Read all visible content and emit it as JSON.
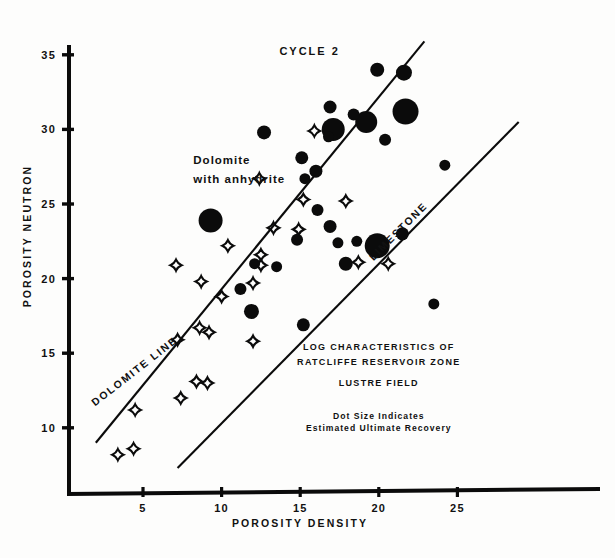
{
  "chart_data": {
    "type": "scatter",
    "subtitle": "LUSTRE FIELD",
    "xlabel": "POROSITY DENSITY",
    "ylabel": "POROSITY NEUTRON",
    "xlim": [
      1.5,
      28.5
    ],
    "ylim": [
      7.2,
      36.4
    ],
    "xticks": [
      5,
      10,
      15,
      20,
      25
    ],
    "yticks": [
      10,
      15,
      20,
      25,
      30,
      35
    ],
    "grid": false,
    "legend": "none",
    "annotations": [
      {
        "name": "cycle-label",
        "text": "CYCLE 2",
        "x": 15.6,
        "y": 35.0
      },
      {
        "name": "dolomite-anhydrite-label-line1",
        "text": "Dolomite",
        "x": 8.2,
        "y": 27.7
      },
      {
        "name": "dolomite-anhydrite-label-line2",
        "text": "with anhydrite",
        "x": 8.2,
        "y": 26.4
      },
      {
        "name": "dolomite-line-label",
        "text": "DOLOMITE LINE",
        "x": 4.6,
        "y": 13.6,
        "rotation": -38
      },
      {
        "name": "limestone-line-label",
        "text": "LIMESTONE",
        "x": 21.4,
        "y": 23.0,
        "rotation": -45
      },
      {
        "name": "title-block-line1",
        "text": "LOG CHARACTERISTICS OF",
        "x": 20.0,
        "y": 15.2
      },
      {
        "name": "title-block-line2",
        "text": "RATCLIFFE RESERVOIR ZONE",
        "x": 20.0,
        "y": 14.2
      },
      {
        "name": "title-block-line3",
        "text": "LUSTRE FIELD",
        "x": 20.0,
        "y": 12.8
      },
      {
        "name": "legend-note-line1",
        "text": "Dot Size Indicates",
        "x": 20.0,
        "y": 10.6
      },
      {
        "name": "legend-note-line2",
        "text": "Estimated Ultimate Recovery",
        "x": 20.0,
        "y": 9.8
      }
    ],
    "reference_lines": [
      {
        "name": "dolomite-line",
        "label": "DOLOMITE LINE",
        "x0": 2.0,
        "y0": 9.0,
        "x1": 22.9,
        "y1": 35.9
      },
      {
        "name": "limestone-line",
        "label": "LIMESTONE",
        "x0": 7.2,
        "y0": 7.3,
        "x1": 28.9,
        "y1": 30.5
      }
    ],
    "series": [
      {
        "name": "Wells (dot size = estimated ultimate recovery)",
        "marker": "filled-circle",
        "points": [
          {
            "x": 21.6,
            "y": 33.8,
            "r": 8.0
          },
          {
            "x": 19.9,
            "y": 34.0,
            "r": 7.0
          },
          {
            "x": 16.9,
            "y": 31.5,
            "r": 6.5
          },
          {
            "x": 17.1,
            "y": 30.0,
            "r": 11.5
          },
          {
            "x": 19.2,
            "y": 30.5,
            "r": 11.0
          },
          {
            "x": 21.7,
            "y": 31.2,
            "r": 13.0
          },
          {
            "x": 12.7,
            "y": 29.8,
            "r": 7.0
          },
          {
            "x": 16.8,
            "y": 29.5,
            "r": 5.5
          },
          {
            "x": 18.4,
            "y": 31.0,
            "r": 6.0
          },
          {
            "x": 20.4,
            "y": 29.3,
            "r": 6.0
          },
          {
            "x": 15.1,
            "y": 28.1,
            "r": 6.5
          },
          {
            "x": 15.3,
            "y": 26.7,
            "r": 5.5
          },
          {
            "x": 16.0,
            "y": 27.2,
            "r": 6.5
          },
          {
            "x": 24.2,
            "y": 27.6,
            "r": 5.5
          },
          {
            "x": 9.3,
            "y": 23.9,
            "r": 12.0
          },
          {
            "x": 16.1,
            "y": 24.6,
            "r": 6.0
          },
          {
            "x": 16.9,
            "y": 23.5,
            "r": 6.5
          },
          {
            "x": 14.8,
            "y": 22.6,
            "r": 6.0
          },
          {
            "x": 17.4,
            "y": 22.4,
            "r": 5.5
          },
          {
            "x": 18.6,
            "y": 22.5,
            "r": 5.5
          },
          {
            "x": 19.9,
            "y": 22.2,
            "r": 12.5
          },
          {
            "x": 21.5,
            "y": 23.0,
            "r": 6.5
          },
          {
            "x": 12.1,
            "y": 21.0,
            "r": 5.5
          },
          {
            "x": 13.5,
            "y": 20.8,
            "r": 5.5
          },
          {
            "x": 17.9,
            "y": 21.0,
            "r": 7.0
          },
          {
            "x": 11.2,
            "y": 19.3,
            "r": 6.0
          },
          {
            "x": 11.9,
            "y": 17.8,
            "r": 7.5
          },
          {
            "x": 15.2,
            "y": 16.9,
            "r": 6.5
          },
          {
            "x": 23.5,
            "y": 18.3,
            "r": 5.5
          }
        ]
      },
      {
        "name": "Dolomite with anhydrite",
        "marker": "four-point-star",
        "points": [
          {
            "x": 15.9,
            "y": 29.9,
            "r": 5.5
          },
          {
            "x": 12.4,
            "y": 26.7,
            "r": 5.5
          },
          {
            "x": 15.2,
            "y": 25.3,
            "r": 5.5
          },
          {
            "x": 17.9,
            "y": 25.2,
            "r": 5.5
          },
          {
            "x": 13.3,
            "y": 23.4,
            "r": 5.5
          },
          {
            "x": 14.9,
            "y": 23.3,
            "r": 5.5
          },
          {
            "x": 10.4,
            "y": 22.2,
            "r": 5.5
          },
          {
            "x": 12.5,
            "y": 21.6,
            "r": 5.5
          },
          {
            "x": 18.7,
            "y": 21.1,
            "r": 5.5
          },
          {
            "x": 20.6,
            "y": 21.0,
            "r": 5.5
          },
          {
            "x": 7.1,
            "y": 20.9,
            "r": 5.5
          },
          {
            "x": 8.7,
            "y": 19.8,
            "r": 5.5
          },
          {
            "x": 12.0,
            "y": 19.7,
            "r": 5.5
          },
          {
            "x": 10.0,
            "y": 18.8,
            "r": 5.5
          },
          {
            "x": 8.6,
            "y": 16.7,
            "r": 5.5
          },
          {
            "x": 9.2,
            "y": 16.4,
            "r": 5.5
          },
          {
            "x": 12.0,
            "y": 15.8,
            "r": 5.5
          },
          {
            "x": 7.2,
            "y": 15.9,
            "r": 5.5
          },
          {
            "x": 8.4,
            "y": 13.1,
            "r": 5.5
          },
          {
            "x": 9.1,
            "y": 13.0,
            "r": 5.5
          },
          {
            "x": 7.4,
            "y": 12.0,
            "r": 5.5
          },
          {
            "x": 4.5,
            "y": 11.2,
            "r": 5.5
          },
          {
            "x": 4.4,
            "y": 8.6,
            "r": 5.5
          },
          {
            "x": 3.4,
            "y": 8.2,
            "r": 5.5
          },
          {
            "x": 12.5,
            "y": 20.9,
            "r": 5.5
          }
        ]
      }
    ]
  },
  "axes": {
    "y_title": "POROSITY NEUTRON",
    "x_title": "POROSITY DENSITY",
    "y_tick_labels": [
      "35",
      "30",
      "25",
      "20",
      "15",
      "10"
    ],
    "x_tick_labels": [
      "5",
      "10",
      "15",
      "20",
      "25"
    ]
  },
  "colors": {
    "ink": "#0b0b0b",
    "paper": "#fdfdfc"
  }
}
